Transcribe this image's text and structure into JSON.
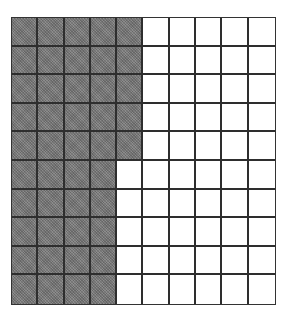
{
  "diagram": {
    "type": "hundred-grid",
    "rows": 10,
    "columns": 10,
    "total_cells": 100,
    "shaded_cells": 45,
    "unshaded_cells": 55,
    "shaded_per_row": [
      5,
      5,
      5,
      5,
      5,
      4,
      4,
      4,
      4,
      4
    ],
    "colors": {
      "shaded": "#7c7c7c",
      "unshaded": "#ffffff",
      "gridline": "#2e2e2e"
    }
  }
}
